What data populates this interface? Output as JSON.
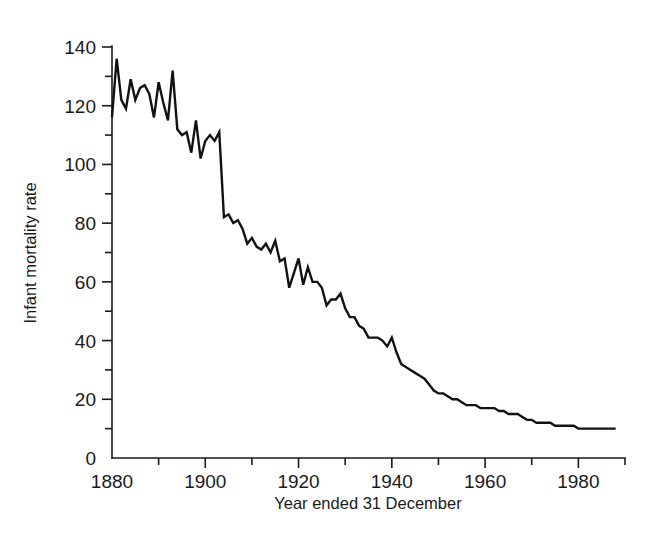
{
  "chart_data": {
    "type": "line",
    "title": "",
    "xlabel": "Year ended 31 December",
    "ylabel": "Infant mortality rate",
    "xlim": [
      1880,
      1990
    ],
    "ylim": [
      0,
      140
    ],
    "grid": false,
    "legend": null,
    "xticks": [
      1880,
      1900,
      1920,
      1940,
      1960,
      1980
    ],
    "xticks_minor": [
      1890,
      1910,
      1930,
      1950,
      1970,
      1990
    ],
    "yticks": [
      0,
      20,
      40,
      60,
      80,
      100,
      120,
      140
    ],
    "yticks_minor": [
      10,
      30,
      50,
      70,
      90,
      110,
      130
    ],
    "xtick_labels": [
      "1880",
      "1900",
      "1920",
      "1940",
      "1960",
      "1980"
    ],
    "ytick_labels": [
      "0",
      "20",
      "40",
      "60",
      "80",
      "100",
      "120",
      "140"
    ],
    "line_color": "#121212",
    "series": [
      {
        "name": "Infant mortality rate",
        "x": [
          1880,
          1881,
          1882,
          1883,
          1884,
          1885,
          1886,
          1887,
          1888,
          1889,
          1890,
          1891,
          1892,
          1893,
          1894,
          1895,
          1896,
          1897,
          1898,
          1899,
          1900,
          1901,
          1902,
          1903,
          1904,
          1905,
          1906,
          1907,
          1908,
          1909,
          1910,
          1911,
          1912,
          1913,
          1914,
          1915,
          1916,
          1917,
          1918,
          1919,
          1920,
          1921,
          1922,
          1923,
          1924,
          1925,
          1926,
          1927,
          1928,
          1929,
          1930,
          1931,
          1932,
          1933,
          1934,
          1935,
          1936,
          1937,
          1938,
          1939,
          1940,
          1941,
          1942,
          1943,
          1944,
          1945,
          1946,
          1947,
          1948,
          1949,
          1950,
          1951,
          1952,
          1953,
          1954,
          1955,
          1956,
          1957,
          1958,
          1959,
          1960,
          1961,
          1962,
          1963,
          1964,
          1965,
          1966,
          1967,
          1968,
          1969,
          1970,
          1971,
          1972,
          1973,
          1974,
          1975,
          1976,
          1977,
          1978,
          1979,
          1980,
          1981,
          1982,
          1983,
          1984,
          1985,
          1986,
          1987,
          1988
        ],
        "values": [
          116,
          136,
          122,
          119,
          129,
          122,
          126,
          127,
          124,
          116,
          128,
          121,
          115,
          132,
          112,
          110,
          111,
          104,
          115,
          102,
          108,
          110,
          108,
          111,
          82,
          83,
          80,
          81,
          78,
          73,
          75,
          72,
          71,
          73,
          70,
          74,
          67,
          68,
          58,
          63,
          68,
          59,
          65,
          60,
          60,
          58,
          52,
          54,
          54,
          56,
          51,
          48,
          48,
          45,
          44,
          41,
          41,
          41,
          40,
          38,
          41,
          36,
          32,
          31,
          30,
          29,
          28,
          27,
          25,
          23,
          22,
          22,
          21,
          20,
          20,
          19,
          18,
          18,
          18,
          17,
          17,
          17,
          17,
          16,
          16,
          15,
          15,
          15,
          14,
          13,
          13,
          12,
          12,
          12,
          12,
          11,
          11,
          11,
          11,
          11,
          10,
          10,
          10,
          10,
          10,
          10,
          10,
          10,
          10
        ]
      }
    ]
  },
  "axes": {
    "y_axis_title": "Infant mortality rate",
    "x_axis_title": "Year ended 31 December"
  }
}
